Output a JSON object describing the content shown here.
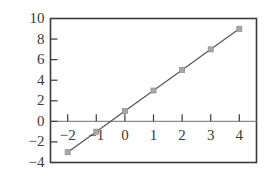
{
  "chart_data": {
    "type": "line",
    "title": "",
    "subtitle": "",
    "xlabel": "",
    "ylabel": "",
    "x": [
      -2,
      -1,
      0,
      1,
      2,
      3,
      4
    ],
    "series": [
      {
        "name": "y = 2x + 1",
        "values": [
          -3,
          -1,
          1,
          3,
          5,
          7,
          9
        ]
      }
    ],
    "xlim": [
      -2.6,
      4.6
    ],
    "ylim": [
      -4,
      10
    ],
    "xticks": [
      -2,
      -1,
      0,
      1,
      2,
      3,
      4
    ],
    "yticks": [
      -4,
      -2,
      0,
      2,
      4,
      6,
      8,
      10
    ],
    "xtick_labels": [
      "−2",
      "−1",
      "0",
      "1",
      "2",
      "3",
      "4"
    ],
    "ytick_labels": [
      "−4",
      "−2",
      "0",
      "2",
      "4",
      "6",
      "8",
      "10"
    ],
    "grid": false,
    "legend": "none",
    "annotations": [],
    "colors": {
      "frame": "#3a3a3a",
      "axis_line": "#8c8c8c",
      "line": "#555555",
      "marker_fill": "#a8a8a8",
      "marker_edge": "#8f8f8f",
      "tick_label": "#3a3a3a",
      "background": "#ffffff"
    },
    "marker": "square",
    "marker_size": 5
  },
  "axes": {
    "y_tick_labels": [
      {
        "value": 10,
        "text": "10"
      },
      {
        "value": 8,
        "text": "8"
      },
      {
        "value": 6,
        "text": "6"
      },
      {
        "value": 4,
        "text": "4"
      },
      {
        "value": 2,
        "text": "2"
      },
      {
        "value": 0,
        "text": "0"
      },
      {
        "value": -2,
        "text": "−2"
      },
      {
        "value": -4,
        "text": "−4"
      }
    ],
    "x_tick_labels": [
      {
        "value": -2,
        "text": "−2"
      },
      {
        "value": -1,
        "text": "−1"
      },
      {
        "value": 0,
        "text": "0"
      },
      {
        "value": 1,
        "text": "1"
      },
      {
        "value": 2,
        "text": "2"
      },
      {
        "value": 3,
        "text": "3"
      },
      {
        "value": 4,
        "text": "4"
      }
    ]
  }
}
